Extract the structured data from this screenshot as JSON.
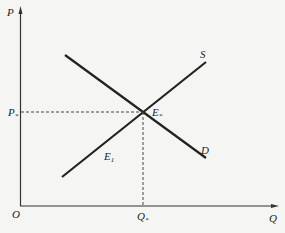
{
  "diagram": {
    "type": "supply-demand",
    "axes": {
      "y_label": "P",
      "x_label": "Q",
      "origin_label": "O"
    },
    "curves": [
      {
        "name": "supply",
        "label": "S"
      },
      {
        "name": "demand",
        "label": "D"
      }
    ],
    "equilibrium": {
      "point_label": "E",
      "point_sub": "*",
      "price_label": "P",
      "price_sub": "*",
      "quantity_label": "Q",
      "quantity_sub": "*"
    },
    "other_labels": {
      "e1_label": "E",
      "e1_sub": "1"
    },
    "colors": {
      "line": "#222222",
      "background": "#f5f5f3"
    }
  }
}
